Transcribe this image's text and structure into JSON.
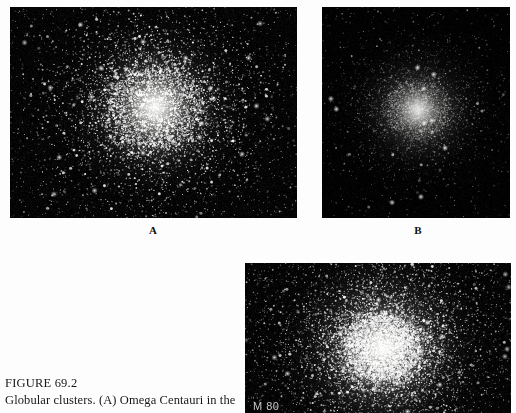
{
  "page": {
    "background_color": "#fdfdfd",
    "width": 516,
    "height": 413
  },
  "caption": {
    "figure_number": "FIGURE 69.2",
    "text": "Globular clusters. (A) Omega Centauri in the"
  },
  "panels": [
    {
      "id": "a",
      "label": "A",
      "object": "Omega Centauri",
      "appearance": "resolved granular star cluster with dense bright core",
      "background_color": "#010101",
      "star_color": "#ffffff"
    },
    {
      "id": "b",
      "label": "B",
      "object": "",
      "appearance": "smooth diffuse unresolved glow with bright centre",
      "background_color": "#010101",
      "star_color": "#ffffff"
    },
    {
      "id": "c",
      "label": "",
      "object": "M 80",
      "appearance": "dense resolved star field with brilliant core",
      "background_color": "#050505",
      "star_color": "#ffffff"
    }
  ],
  "chart_data": {
    "type": "scatter",
    "title": "FIGURE 69.2",
    "subtitle": "Globular clusters. (A) Omega Centauri in the",
    "xlabel": "",
    "ylabel": "",
    "grid": false,
    "legend_position": "none",
    "series": [
      {
        "name": "A",
        "object": "Omega Centauri",
        "panel_rect": [
          10,
          7,
          287,
          211
        ],
        "core_center": [
          145,
          100
        ],
        "core_radius_px": 42,
        "halo_radius_px": 105,
        "star_count": 5200,
        "core_brightness": 0.95,
        "resolved": true,
        "seed": 11
      },
      {
        "name": "B",
        "object": "",
        "panel_rect": [
          322,
          7,
          188,
          211
        ],
        "core_center": [
          96,
          103
        ],
        "core_radius_px": 30,
        "halo_radius_px": 82,
        "star_count": 3400,
        "core_brightness": 0.78,
        "resolved": false,
        "seed": 23
      },
      {
        "name": "C",
        "object": "M 80",
        "panel_rect": [
          245,
          263,
          266,
          150
        ],
        "core_center": [
          138,
          85
        ],
        "core_radius_px": 34,
        "halo_radius_px": 120,
        "star_count": 7200,
        "core_brightness": 1.0,
        "resolved": true,
        "seed": 37
      }
    ]
  }
}
